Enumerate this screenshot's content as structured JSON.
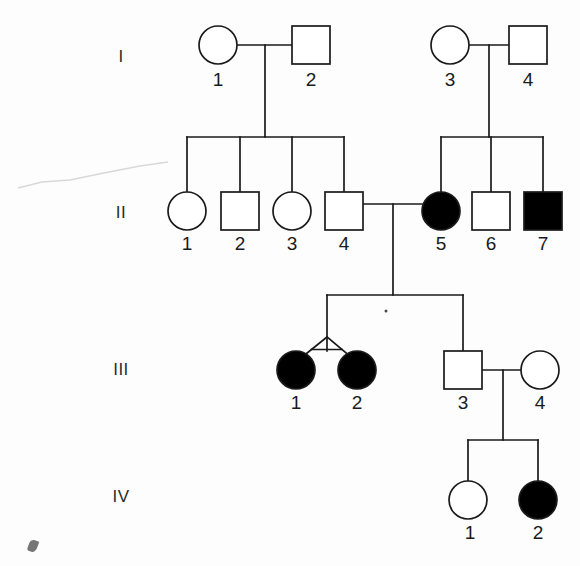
{
  "figure": {
    "kind": "pedigree-chart",
    "width": 580,
    "height": 566,
    "background_color": "#fdfdfd",
    "stroke_color": "#1a1a1a",
    "affected_fill_color": "#000000",
    "unaffected_fill_color": "#ffffff"
  },
  "generations": [
    {
      "id": "I",
      "label": "I",
      "label_x": 121,
      "label_y": 57,
      "row_y": 45
    },
    {
      "id": "II",
      "label": "II",
      "label_x": 121,
      "label_y": 213,
      "row_y": 211
    },
    {
      "id": "III",
      "label": "III",
      "label_x": 121,
      "label_y": 370,
      "row_y": 370
    },
    {
      "id": "IV",
      "label": "IV",
      "label_x": 121,
      "label_y": 497,
      "row_y": 500
    }
  ],
  "individuals": [
    {
      "key": "I-1",
      "generation": "I",
      "number": "1",
      "sex": "female",
      "shape": "circle",
      "affected": false,
      "x": 218,
      "y": 45,
      "size": 38,
      "label_x": 218,
      "label_y": 80
    },
    {
      "key": "I-2",
      "generation": "I",
      "number": "2",
      "sex": "male",
      "shape": "square",
      "affected": false,
      "x": 311,
      "y": 45,
      "size": 38,
      "label_x": 311,
      "label_y": 80
    },
    {
      "key": "I-3",
      "generation": "I",
      "number": "3",
      "sex": "female",
      "shape": "circle",
      "affected": false,
      "x": 450,
      "y": 45,
      "size": 38,
      "label_x": 450,
      "label_y": 80
    },
    {
      "key": "I-4",
      "generation": "I",
      "number": "4",
      "sex": "male",
      "shape": "square",
      "affected": false,
      "x": 528,
      "y": 45,
      "size": 38,
      "label_x": 528,
      "label_y": 80
    },
    {
      "key": "II-1",
      "generation": "II",
      "number": "1",
      "sex": "female",
      "shape": "circle",
      "affected": false,
      "x": 187,
      "y": 211,
      "size": 38,
      "label_x": 187,
      "label_y": 244
    },
    {
      "key": "II-2",
      "generation": "II",
      "number": "2",
      "sex": "male",
      "shape": "square",
      "affected": false,
      "x": 240,
      "y": 211,
      "size": 38,
      "label_x": 240,
      "label_y": 244
    },
    {
      "key": "II-3",
      "generation": "II",
      "number": "3",
      "sex": "female",
      "shape": "circle",
      "affected": false,
      "x": 292,
      "y": 211,
      "size": 38,
      "label_x": 292,
      "label_y": 244
    },
    {
      "key": "II-4",
      "generation": "II",
      "number": "4",
      "sex": "male",
      "shape": "square",
      "affected": false,
      "x": 344,
      "y": 211,
      "size": 38,
      "label_x": 344,
      "label_y": 244
    },
    {
      "key": "II-5",
      "generation": "II",
      "number": "5",
      "sex": "female",
      "shape": "circle",
      "affected": true,
      "x": 441,
      "y": 211,
      "size": 38,
      "label_x": 441,
      "label_y": 244
    },
    {
      "key": "II-6",
      "generation": "II",
      "number": "6",
      "sex": "male",
      "shape": "square",
      "affected": false,
      "x": 491,
      "y": 211,
      "size": 38,
      "label_x": 491,
      "label_y": 244
    },
    {
      "key": "II-7",
      "generation": "II",
      "number": "7",
      "sex": "male",
      "shape": "square",
      "affected": true,
      "x": 543,
      "y": 211,
      "size": 38,
      "label_x": 543,
      "label_y": 244
    },
    {
      "key": "III-1",
      "generation": "III",
      "number": "1",
      "sex": "female",
      "shape": "circle",
      "affected": true,
      "x": 296,
      "y": 370,
      "size": 38,
      "label_x": 296,
      "label_y": 403
    },
    {
      "key": "III-2",
      "generation": "III",
      "number": "2",
      "sex": "female",
      "shape": "circle",
      "affected": true,
      "x": 357,
      "y": 370,
      "size": 38,
      "label_x": 357,
      "label_y": 403
    },
    {
      "key": "III-3",
      "generation": "III",
      "number": "3",
      "sex": "male",
      "shape": "square",
      "affected": false,
      "x": 463,
      "y": 370,
      "size": 38,
      "label_x": 463,
      "label_y": 403
    },
    {
      "key": "III-4",
      "generation": "III",
      "number": "4",
      "sex": "female",
      "shape": "circle",
      "affected": false,
      "x": 540,
      "y": 370,
      "size": 38,
      "label_x": 540,
      "label_y": 403
    },
    {
      "key": "IV-1",
      "generation": "IV",
      "number": "1",
      "sex": "female",
      "shape": "circle",
      "affected": false,
      "x": 468,
      "y": 500,
      "size": 38,
      "label_x": 470,
      "label_y": 533
    },
    {
      "key": "IV-2",
      "generation": "IV",
      "number": "2",
      "sex": "male",
      "shape": "circle",
      "affected": true,
      "x": 538,
      "y": 500,
      "size": 38,
      "label_x": 538,
      "label_y": 533
    }
  ],
  "matings": [
    {
      "key": "I-1xI-2",
      "partner_a": "I-1",
      "partner_b": "I-2",
      "line_y": 45,
      "x_start": 237,
      "x_end": 292,
      "descent_x": 265,
      "descent_y_end": 137
    },
    {
      "key": "I-3xI-4",
      "partner_a": "I-3",
      "partner_b": "I-4",
      "line_y": 45,
      "x_start": 469,
      "x_end": 509,
      "descent_x": 489,
      "descent_y_end": 137
    },
    {
      "key": "II-4xII-5",
      "partner_a": "II-4",
      "partner_b": "II-5",
      "line_y": 204,
      "x_start": 363,
      "x_end": 422,
      "descent_x": 393,
      "descent_y_end": 295
    },
    {
      "key": "III-3xIII-4",
      "partner_a": "III-3",
      "partner_b": "III-4",
      "line_y": 370,
      "x_start": 482,
      "x_end": 521,
      "descent_x": 503,
      "descent_y_end": 440
    }
  ],
  "sibships": [
    {
      "key": "sibship-II-left",
      "parents": "I-1xI-2",
      "bar_y": 137,
      "bar_x_start": 187,
      "bar_x_end": 344,
      "children_x": [
        187,
        240,
        292,
        344
      ],
      "child_stub_y_end": 192
    },
    {
      "key": "sibship-II-right",
      "parents": "I-3xI-4",
      "bar_y": 137,
      "bar_x_start": 441,
      "bar_x_end": 543,
      "children_x": [
        441,
        491,
        543
      ],
      "child_stub_y_end": 192
    },
    {
      "key": "sibship-III",
      "parents": "II-4xII-5",
      "bar_y": 295,
      "bar_x_start": 327,
      "bar_x_end": 463,
      "children_x": [
        327,
        463
      ],
      "child_stub_y_end": 351
    },
    {
      "key": "sibship-IV",
      "parents": "III-3xIII-4",
      "bar_y": 440,
      "bar_x_start": 468,
      "bar_x_end": 538,
      "children_x": [
        468,
        538
      ],
      "child_stub_y_end": 481
    }
  ],
  "twins": [
    {
      "key": "twin-group-III-1-III-2",
      "members": [
        "III-1",
        "III-2"
      ],
      "zygosity": "unknown",
      "apex_x": 327,
      "apex_y": 337,
      "left_x": 296,
      "right_x": 357,
      "base_y": 362,
      "has_crossbar": true
    }
  ],
  "artifacts": [
    {
      "key": "scan-scratch",
      "type": "faint-line",
      "points": "18,188 42,182 70,180 104,173 140,166 168,162"
    },
    {
      "key": "scan-speck",
      "type": "dark-speck",
      "x": 33,
      "y": 546
    },
    {
      "key": "ink-dot",
      "type": "dot",
      "x": 386,
      "y": 311
    }
  ],
  "legend_notes": {
    "filled_meaning": "affected",
    "unfilled_meaning": "unaffected",
    "circle_meaning": "female",
    "square_meaning": "male"
  }
}
